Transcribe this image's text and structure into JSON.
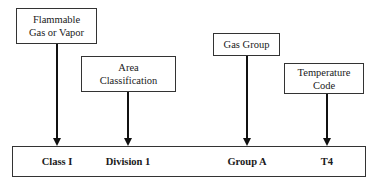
{
  "diagram": {
    "type": "marking-code-breakdown",
    "category_boxes": [
      {
        "id": "flammable",
        "lines": [
          "Flammable",
          "Gas or Vapor"
        ]
      },
      {
        "id": "area",
        "lines": [
          "Area",
          "Classification"
        ]
      },
      {
        "id": "gas-group",
        "lines": [
          "Gas Group"
        ]
      },
      {
        "id": "temperature",
        "lines": [
          "Temperature",
          "Code"
        ]
      }
    ],
    "codes": [
      {
        "label": "Class I",
        "points_from": "flammable"
      },
      {
        "label": "Division 1",
        "points_from": "area"
      },
      {
        "label": "Group A",
        "points_from": "gas-group"
      },
      {
        "label": "T4",
        "points_from": "temperature"
      }
    ],
    "colors": {
      "line": "#111111",
      "box_border": "#333333",
      "background": "#ffffff"
    }
  }
}
